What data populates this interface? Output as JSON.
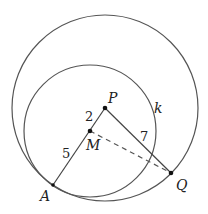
{
  "diagram": {
    "type": "geometry",
    "colors": {
      "stroke": "#555555",
      "point": "#111111",
      "text": "#222222"
    },
    "points": {
      "P": {
        "label": "P",
        "x": 105,
        "y": 108
      },
      "M": {
        "label": "M",
        "x": 90,
        "y": 131
      },
      "A": {
        "label": "A",
        "x": 53,
        "y": 185
      },
      "Q": {
        "label": "Q",
        "x": 171,
        "y": 173
      }
    },
    "circles": {
      "big": {
        "center": "P",
        "r": 93
      },
      "k": {
        "label": "k",
        "center": "M",
        "r": 66
      }
    },
    "segments": [
      {
        "from": "P",
        "to": "A",
        "style": "solid"
      },
      {
        "from": "P",
        "to": "Q",
        "style": "solid"
      },
      {
        "from": "M",
        "to": "Q",
        "style": "dashed"
      }
    ],
    "lengths": {
      "PM": "2",
      "MA": "5",
      "PQ": "7"
    }
  }
}
